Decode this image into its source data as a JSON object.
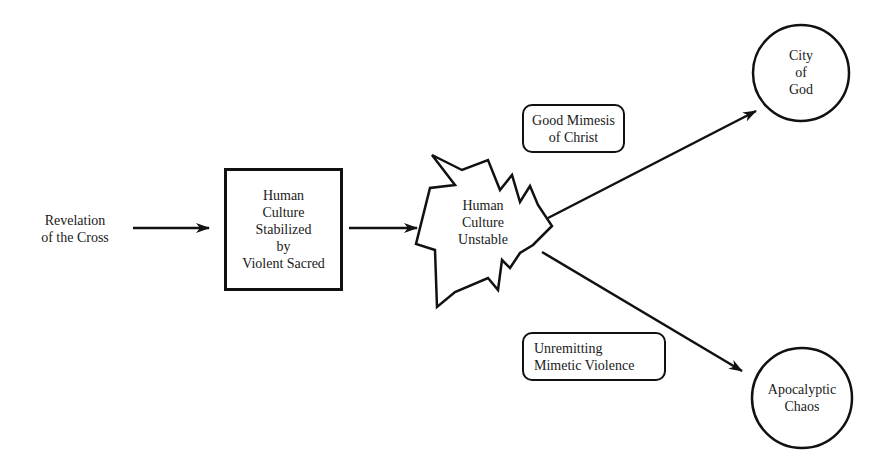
{
  "diagram": {
    "nodes": {
      "source": {
        "lines": [
          "Revelation",
          "of the Cross"
        ]
      },
      "stabilized": {
        "lines": [
          "Human",
          "Culture",
          "Stabilized",
          "by",
          "Violent Sacred"
        ]
      },
      "unstable": {
        "lines": [
          "Human",
          "Culture",
          "Unstable"
        ]
      },
      "city_of_god": {
        "lines": [
          "City",
          "of",
          "God"
        ]
      },
      "apocalyptic_chaos": {
        "lines": [
          "Apocalyptic",
          "Chaos"
        ]
      }
    },
    "edge_labels": {
      "good_mimesis": {
        "lines": [
          "Good Mimesis",
          "of Christ"
        ]
      },
      "unremitting": {
        "lines": [
          "Unremitting",
          "Mimetic Violence"
        ]
      }
    },
    "edges": [
      {
        "from": "source",
        "to": "stabilized"
      },
      {
        "from": "stabilized",
        "to": "unstable"
      },
      {
        "from": "unstable",
        "to": "city_of_god",
        "label": "good_mimesis"
      },
      {
        "from": "unstable",
        "to": "apocalyptic_chaos",
        "label": "unremitting"
      }
    ],
    "colors": {
      "stroke": "#111111",
      "text": "#1a1a1a",
      "background": "#ffffff"
    }
  }
}
